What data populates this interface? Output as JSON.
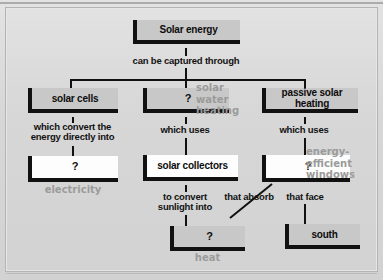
{
  "diagram": {
    "title": "Solar energy",
    "type": "concept-map",
    "nodes": {
      "root": {
        "label": "Solar energy",
        "fill": "gray"
      },
      "solar_cells": {
        "label": "solar cells",
        "fill": "gray"
      },
      "q_middle": {
        "label": "?",
        "fill": "gray"
      },
      "passive_solar": {
        "label": "passive solar\nheating",
        "fill": "gray"
      },
      "q_electricity": {
        "label": "?",
        "fill": "white"
      },
      "solar_collectors": {
        "label": "solar collectors",
        "fill": "white"
      },
      "q_windows": {
        "label": "?",
        "fill": "white"
      },
      "q_heat": {
        "label": "?",
        "fill": "gray"
      },
      "south": {
        "label": "south",
        "fill": "gray"
      }
    },
    "links": [
      {
        "from": "root",
        "to": "branch-bus",
        "label": "can be captured through"
      },
      {
        "from": "solar_cells",
        "to": "q_electricity",
        "label": "which convert the\nenergy directly into"
      },
      {
        "from": "q_middle",
        "to": "solar_collectors",
        "label": "which uses"
      },
      {
        "from": "passive_solar",
        "to": "q_windows",
        "label": "which uses"
      },
      {
        "from": "solar_collectors",
        "to": "q_heat",
        "label": "to convert\nsunlight into"
      },
      {
        "from": "q_windows",
        "to": "q_heat",
        "label": "that absorb"
      },
      {
        "from": "q_windows",
        "to": "south",
        "label": "that face"
      }
    ],
    "answers": {
      "middle_branch": "solar\nwater\nheating",
      "electricity": "electricity",
      "windows": "energy-\nefficient\nwindows",
      "heat": "heat"
    },
    "colors": {
      "page_background": "#d9d9d9",
      "box_fill_gray": "#c8c8c8",
      "box_fill_white": "#fdfdfd",
      "line": "#111111",
      "text": "#0d0d0d",
      "answer_text": "#9b9b9b"
    }
  }
}
